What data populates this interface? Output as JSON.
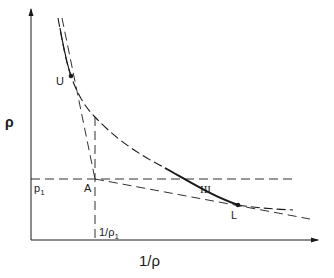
{
  "diagram": {
    "type": "phase-diagram",
    "axes": {
      "x_label": "1/ρ",
      "y_label": "ρ"
    },
    "labels": {
      "point_u": "U",
      "point_l": "L",
      "point_a": "A",
      "p1": "p",
      "p1_sub": "1",
      "inv_rho1": "1/ρ",
      "inv_rho1_sub": "1",
      "region": "III"
    },
    "colors": {
      "line": "#1a1a1a",
      "background": "#ffffff"
    }
  }
}
